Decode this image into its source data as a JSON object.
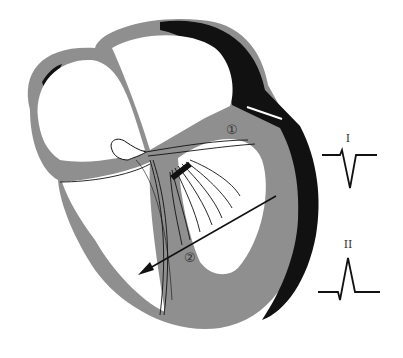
{
  "diagram": {
    "colors": {
      "myocardium": "#8f8f8f",
      "infarct": "#111111",
      "chamber": "#ffffff",
      "line": "#111111"
    },
    "markers": [
      {
        "id": "1",
        "symbol": "①",
        "x": 232,
        "y": 129
      },
      {
        "id": "2",
        "symbol": "②",
        "x": 240,
        "y": 256
      }
    ],
    "vector_arrow": {
      "label": "depolarization vector"
    },
    "ecg_traces": [
      {
        "lead": "I",
        "label": "I",
        "shape": "negative-deflection"
      },
      {
        "lead": "II",
        "label": "II",
        "shape": "positive-deflection"
      }
    ]
  }
}
